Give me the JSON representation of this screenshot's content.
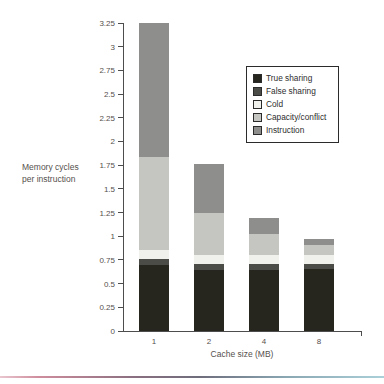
{
  "chart_data": {
    "type": "bar",
    "stacked": true,
    "categories": [
      "1",
      "2",
      "4",
      "8"
    ],
    "xlabel": "Cache size (MB)",
    "ylabel": "Memory cycles per instruction",
    "ylabel_lines": [
      "Memory cycles",
      "per instruction"
    ],
    "ylim": [
      0,
      3.25
    ],
    "y_ticks": [
      "0",
      "0.25",
      "0.5",
      "0.75",
      "1",
      "1.25",
      "1.5",
      "1.75",
      "2",
      "2.25",
      "2.5",
      "2.75",
      "3",
      "3.25"
    ],
    "grid": false,
    "legend_position": "upper right",
    "series": [
      {
        "name": "True sharing",
        "color": "#26261f",
        "values": [
          0.7,
          0.64,
          0.64,
          0.65
        ]
      },
      {
        "name": "False sharing",
        "color": "#4b4b47",
        "values": [
          0.06,
          0.07,
          0.07,
          0.06
        ]
      },
      {
        "name": "Cold",
        "color": "#f0f0ec",
        "values": [
          0.09,
          0.09,
          0.09,
          0.09
        ]
      },
      {
        "name": "Capacity/conflict",
        "color": "#c5c5c2",
        "values": [
          0.99,
          0.45,
          0.22,
          0.11
        ]
      },
      {
        "name": "Instruction",
        "color": "#8e8e8c",
        "values": [
          1.41,
          0.51,
          0.17,
          0.06
        ]
      }
    ],
    "totals": [
      3.25,
      1.76,
      1.19,
      0.97
    ]
  },
  "footer": {
    "divider_colors": [
      "#e9c6ce",
      "#cf8d9d",
      "#8a6f80",
      "#6e6d7c",
      "#8aa8b4",
      "#abd0da"
    ]
  }
}
